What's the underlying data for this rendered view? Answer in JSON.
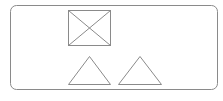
{
  "diagram": {
    "background": "#ffffff",
    "stroke_color": "#8a8a8a",
    "frame": {
      "x": 10.5,
      "y": 5.5,
      "width": 207,
      "height": 84,
      "rx": 6
    },
    "crossed_box": {
      "x": 68.5,
      "y": 10.5,
      "width": 42,
      "height": 35
    },
    "triangles": [
      {
        "points": "68.5,84.5 89.5,56.5 110.5,84.5"
      },
      {
        "points": "118.5,84.5 140,56.5 161.5,84.5"
      }
    ]
  }
}
